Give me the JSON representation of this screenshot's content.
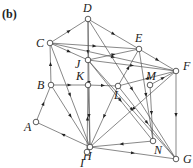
{
  "figure": {
    "tag": "(b)",
    "nodes": [
      {
        "id": "D",
        "x": 88,
        "y": 19,
        "lx": 83,
        "ly": 12
      },
      {
        "id": "C",
        "x": 50,
        "y": 43,
        "lx": 36,
        "ly": 47
      },
      {
        "id": "E",
        "x": 139,
        "y": 49,
        "lx": 135,
        "ly": 42
      },
      {
        "id": "F",
        "x": 176,
        "y": 71,
        "lx": 183,
        "ly": 70
      },
      {
        "id": "J",
        "x": 88,
        "y": 60,
        "lx": 75,
        "ly": 68
      },
      {
        "id": "K",
        "x": 88,
        "y": 85,
        "lx": 76,
        "ly": 80
      },
      {
        "id": "B",
        "x": 51,
        "y": 85,
        "lx": 37,
        "ly": 89
      },
      {
        "id": "L",
        "x": 118,
        "y": 86,
        "lx": 114,
        "ly": 99
      },
      {
        "id": "M",
        "x": 150,
        "y": 85,
        "lx": 146,
        "ly": 80
      },
      {
        "id": "A",
        "x": 36,
        "y": 122,
        "lx": 24,
        "ly": 131
      },
      {
        "id": "H",
        "x": 90,
        "y": 147,
        "lx": 83,
        "ly": 160
      },
      {
        "id": "N",
        "x": 153,
        "y": 141,
        "lx": 154,
        "ly": 154
      },
      {
        "id": "I",
        "x": 87,
        "y": 152,
        "lx": 80,
        "ly": 167
      },
      {
        "id": "G",
        "x": 176,
        "y": 159,
        "lx": 183,
        "ly": 163
      }
    ],
    "edges": [
      [
        "C",
        "D"
      ],
      [
        "D",
        "E"
      ],
      [
        "E",
        "F"
      ],
      [
        "C",
        "E"
      ],
      [
        "C",
        "F"
      ],
      [
        "C",
        "J"
      ],
      [
        "J",
        "F"
      ],
      [
        "D",
        "K"
      ],
      [
        "D",
        "H"
      ],
      [
        "D",
        "G"
      ],
      [
        "J",
        "E"
      ],
      [
        "B",
        "C"
      ],
      [
        "B",
        "K"
      ],
      [
        "K",
        "L"
      ],
      [
        "L",
        "E"
      ],
      [
        "M",
        "F"
      ],
      [
        "A",
        "B"
      ],
      [
        "H",
        "A"
      ],
      [
        "B",
        "H"
      ],
      [
        "C",
        "H"
      ],
      [
        "J",
        "N"
      ],
      [
        "K",
        "H"
      ],
      [
        "L",
        "H"
      ],
      [
        "L",
        "G"
      ],
      [
        "M",
        "N"
      ],
      [
        "F",
        "H"
      ],
      [
        "F",
        "G"
      ],
      [
        "N",
        "H"
      ],
      [
        "H",
        "G"
      ],
      [
        "I",
        "K"
      ],
      [
        "I",
        "H"
      ],
      [
        "E",
        "N"
      ],
      [
        "F",
        "L"
      ],
      [
        "J",
        "G"
      ]
    ]
  }
}
